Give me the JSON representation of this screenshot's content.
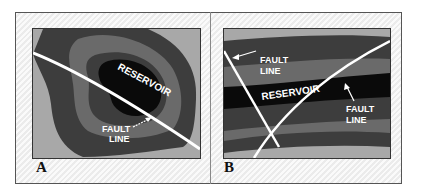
{
  "figure": {
    "panels": [
      {
        "id": "A",
        "label": "A",
        "reservoir_label": "RESERVOIR",
        "fault_label_line1": "FAULT",
        "fault_label_line2": "LINE",
        "description": "Map view: concentric rock layers around a reservoir cut by one fault line"
      },
      {
        "id": "B",
        "label": "B",
        "reservoir_label": "RESERVOIR",
        "fault_left_line1": "FAULT",
        "fault_left_line2": "LINE",
        "fault_right_line1": "FAULT",
        "fault_right_line2": "LINE",
        "description": "Cross-section: layered strata with reservoir trapped between two fault lines"
      }
    ],
    "colors": {
      "outer_layer": "#a8a8a8",
      "layer_dark": "#3d3d3d",
      "layer_mid": "#6a6a6a",
      "reservoir": "#0a0a0a",
      "fault": "#ffffff"
    }
  }
}
